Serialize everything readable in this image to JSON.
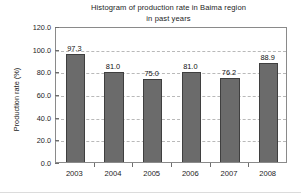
{
  "chart_data": {
    "type": "bar",
    "title": "Histogram of production rate in Baima region\nin past years",
    "title_line1": "Histogram of production rate in Baima region",
    "title_line2": "in past years",
    "xlabel": "",
    "ylabel": "Production rate (%)",
    "categories": [
      "2003",
      "2004",
      "2005",
      "2006",
      "2007",
      "2008"
    ],
    "values": [
      97.3,
      81.0,
      75.0,
      81.0,
      76.2,
      88.9
    ],
    "value_labels": [
      "97.3",
      "81.0",
      "75.0",
      "81.0",
      "76.2",
      "88.9"
    ],
    "ylim": [
      0.0,
      120.0
    ],
    "ytick_step": 20.0,
    "ytick_labels": [
      "0.0",
      "20.0",
      "40.0",
      "60.0",
      "80.0",
      "100.0",
      "120.0"
    ],
    "ytick_values": [
      0,
      20,
      40,
      60,
      80,
      100,
      120
    ],
    "grid": true,
    "grid_axis": "y",
    "grid_style": "dashed",
    "legend": false,
    "bar_color": "#6b6b6b",
    "bar_edge_color": "#3f3f3f",
    "grid_color": "#b9b9b9",
    "frame_color": "#8a8a8a",
    "text_color": "#1d1d1d"
  }
}
